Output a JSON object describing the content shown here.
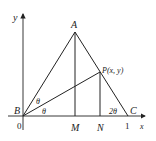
{
  "diagram": {
    "type": "geometry-figure",
    "axes": {
      "x_label": "x",
      "y_label": "y",
      "origin_label": "0",
      "x_tick": "1"
    },
    "points": {
      "A": {
        "label": "A"
      },
      "B": {
        "label": "B"
      },
      "C": {
        "label": "C"
      },
      "M": {
        "label": "M"
      },
      "N": {
        "label": "N"
      },
      "P": {
        "label": "P(x, y)"
      }
    },
    "angles": {
      "upper_theta": "θ",
      "lower_theta": "θ",
      "angle_c": "2θ"
    },
    "segments": [
      "AB",
      "AC",
      "AM",
      "PN",
      "BP",
      "BC"
    ],
    "colors": {
      "stroke": "#222222",
      "background": "#ffffff"
    }
  }
}
